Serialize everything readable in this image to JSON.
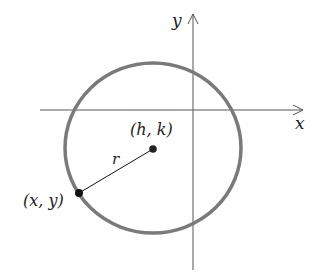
{
  "diagram": {
    "labels": {
      "x_axis": "x",
      "y_axis": "y",
      "center": "(h, k)",
      "point": "(x, y)",
      "radius": "r"
    },
    "colors": {
      "circle": "#7a7a7a",
      "axes": "#555555",
      "radius_line": "#111111",
      "points": "#111111"
    }
  }
}
